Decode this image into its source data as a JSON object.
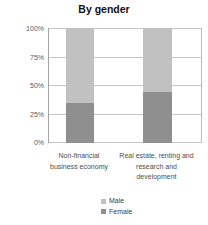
{
  "chart_data": {
    "type": "bar",
    "stacked": true,
    "title": "By gender",
    "categories": [
      "Non-financial business economy",
      "Real estate, renting and research and development"
    ],
    "series": [
      {
        "name": "Female",
        "values": [
          35,
          44
        ],
        "color": "#8f8f8f"
      },
      {
        "name": "Male",
        "values": [
          65,
          56
        ],
        "color": "#c1c1c1"
      }
    ],
    "unit": "%",
    "ylim": [
      0,
      100
    ],
    "yticks": [
      {
        "label": "0%",
        "value": 0
      },
      {
        "label": "25%",
        "value": 25
      },
      {
        "label": "50%",
        "value": 50
      },
      {
        "label": "75%",
        "value": 75
      },
      {
        "label": "100%",
        "value": 100
      }
    ],
    "grid": true,
    "legend": {
      "position": "bottom",
      "items": [
        {
          "label": "Male",
          "color": "#c1c1c1"
        },
        {
          "label": "Female",
          "color": "#8f8f8f"
        }
      ]
    },
    "colors": {
      "gridline": "#c5c5c5",
      "axis_text": "#595959",
      "title_text": "#111111"
    }
  }
}
